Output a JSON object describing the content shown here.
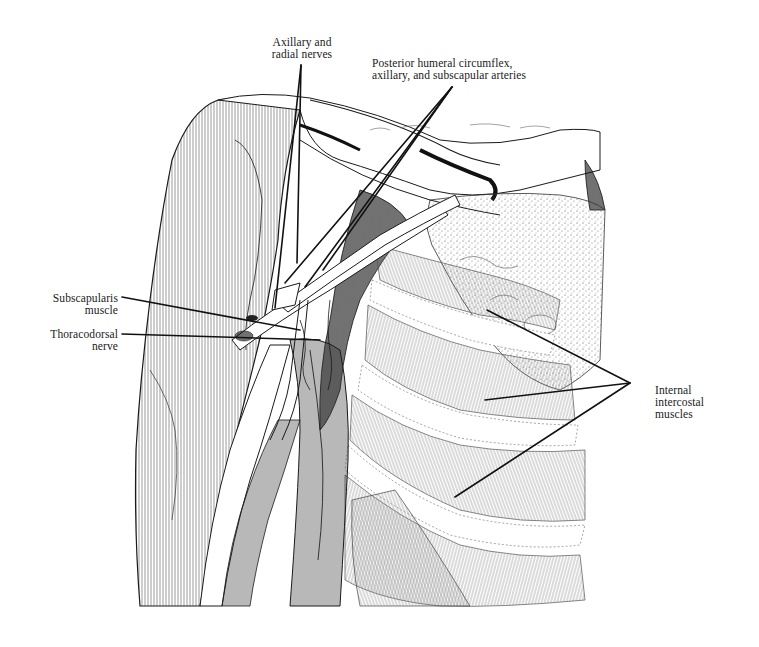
{
  "figure": {
    "type": "anatomical-illustration",
    "style": "pen-and-ink line drawing",
    "ink_color": "#1a1a1a",
    "background_color": "#ffffff"
  },
  "labels": {
    "axillary_radial": {
      "line1": "Axillary and",
      "line2": "radial nerves"
    },
    "arteries": {
      "line1": "Posterior humeral circumflex,",
      "line2": "axillary, and subscapular arteries"
    },
    "subscapularis": {
      "line1": "Subscapularis",
      "line2": "muscle"
    },
    "thoracodorsal": {
      "line1": "Thoracodorsal",
      "line2": "nerve"
    },
    "intercostal": {
      "line1": "Internal",
      "line2": "intercostal",
      "line3": "muscles"
    }
  },
  "leader_lines": [
    {
      "label": "axillary_radial",
      "from": [
        301,
        65
      ],
      "to": [
        [
          275,
          308
        ],
        [
          297,
          263
        ]
      ]
    },
    {
      "label": "arteries",
      "from": [
        452,
        87
      ],
      "to": [
        [
          285,
          283
        ],
        [
          305,
          287
        ],
        [
          323,
          270
        ]
      ]
    },
    {
      "label": "subscapularis",
      "from": [
        122,
        297
      ],
      "to": [
        [
          300,
          330
        ]
      ]
    },
    {
      "label": "thoracodorsal",
      "from": [
        122,
        334
      ],
      "to": [
        [
          320,
          340
        ]
      ]
    },
    {
      "label": "intercostal",
      "from": [
        630,
        383
      ],
      "to": [
        [
          487,
          310
        ],
        [
          485,
          400
        ],
        [
          455,
          497
        ]
      ]
    }
  ]
}
